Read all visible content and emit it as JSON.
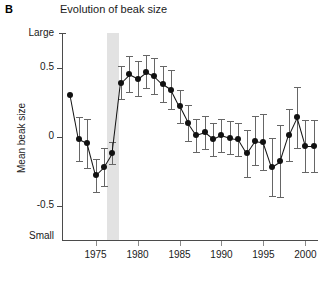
{
  "panel": {
    "label": "B"
  },
  "chart_data": {
    "type": "line",
    "title": "Evolution of beak size",
    "xlabel": "",
    "ylabel": "Mean beak size",
    "ylim": [
      -0.75,
      0.75
    ],
    "xlim": [
      1971.0,
      2001.5
    ],
    "grid": false,
    "legend": "none",
    "y_ticks": [
      0.5,
      0,
      -0.5
    ],
    "y_tick_labels": [
      "0.5",
      "0",
      "-0.5"
    ],
    "y_axis_end_labels": {
      "top": "Large",
      "bottom": "Small"
    },
    "x_ticks": [
      1975,
      1980,
      1985,
      1990,
      1995,
      2000
    ],
    "x_tick_labels": [
      "1975",
      "1980",
      "1985",
      "1990",
      "1995",
      "2000"
    ],
    "marker": "filled-circle",
    "error_bars": "vertical-capped",
    "annotations": [
      {
        "name": "drought-band",
        "type": "vspan",
        "x0": 1976.4,
        "x1": 1977.8,
        "color": "#d8d8d8"
      }
    ],
    "x": [
      1972,
      1973,
      1974,
      1975,
      1976,
      1977,
      1978,
      1979,
      1980,
      1981,
      1982,
      1983,
      1984,
      1985,
      1986,
      1987,
      1988,
      1989,
      1990,
      1991,
      1992,
      1993,
      1994,
      1995,
      1996,
      1997,
      1998,
      1999,
      2000,
      2001
    ],
    "values": [
      0.3,
      -0.02,
      -0.05,
      -0.28,
      -0.22,
      -0.12,
      0.39,
      0.45,
      0.42,
      0.47,
      0.44,
      0.38,
      0.34,
      0.22,
      0.1,
      0.01,
      0.03,
      -0.02,
      0.01,
      -0.01,
      -0.02,
      -0.12,
      -0.03,
      -0.04,
      -0.22,
      -0.18,
      0.01,
      0.14,
      -0.07,
      -0.07
    ],
    "errors": [
      0.0,
      0.16,
      0.18,
      0.12,
      0.14,
      0.08,
      0.12,
      0.13,
      0.13,
      0.12,
      0.13,
      0.13,
      0.14,
      0.12,
      0.13,
      0.12,
      0.12,
      0.12,
      0.12,
      0.12,
      0.12,
      0.17,
      0.18,
      0.2,
      0.21,
      0.26,
      0.19,
      0.22,
      0.19,
      0.19
    ]
  },
  "colors": {
    "marker": "#111111",
    "line": "#111111",
    "error": "#666666",
    "axis": "#4b4b4b",
    "band": "#d8d8d8",
    "text": "#1a1a1a",
    "background": "#ffffff"
  }
}
